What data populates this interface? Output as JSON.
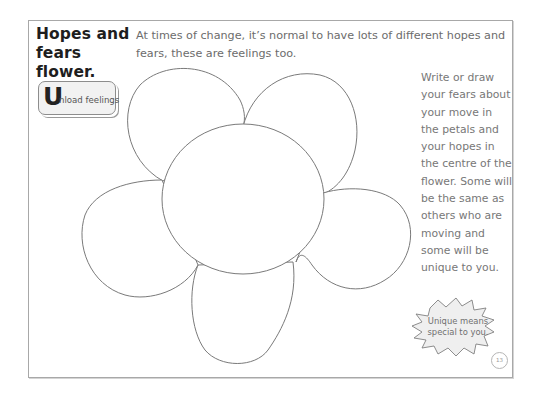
{
  "worksheet": {
    "title_line1": "Hopes and",
    "title_line2": "fears flower.",
    "intro_text": "At times of change, it’s normal to have lots of different hopes and fears, these are feelings too.",
    "badge": {
      "initial": "U",
      "rest": "nload feelings"
    },
    "instructions": "Write or draw your fears about your move in the petals and your hopes in the centre of the flower. Some will be the same as others who are moving and some will be unique to you.",
    "callout": {
      "line1": "Unique means",
      "line2": "special to you."
    },
    "page_number": "13",
    "flower": {
      "petals": 5,
      "stroke_color": "#7a7a7a",
      "regions": [
        "petal-top-left",
        "petal-top-right",
        "petal-right",
        "petal-bottom",
        "petal-left",
        "centre"
      ]
    },
    "colors": {
      "title": "#1e1e1e",
      "body_text": "#6c6c6c",
      "frame_border": "#a8a8a8",
      "badge_fill": "#f2f2f2",
      "callout_fill": "#efefef"
    }
  }
}
